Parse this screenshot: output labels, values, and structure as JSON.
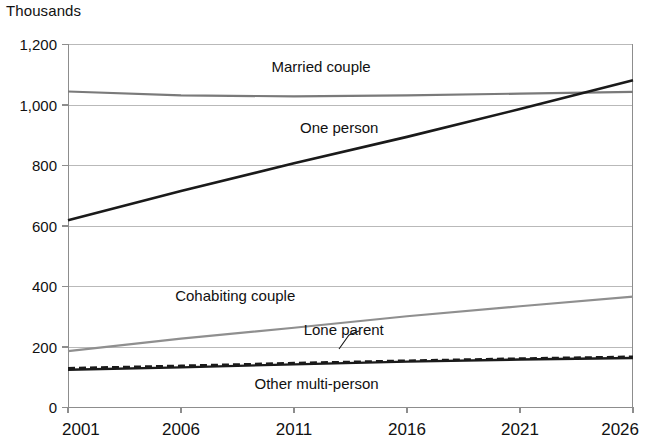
{
  "unit_label": "Thousands",
  "chart_data": {
    "type": "line",
    "title": "",
    "subtitle": "",
    "xlabel": "",
    "ylabel": "Thousands",
    "xlim": [
      2001,
      2026
    ],
    "ylim": [
      0,
      1200
    ],
    "yticks": [
      "0",
      "200",
      "400",
      "600",
      "800",
      "1,000",
      "1,200"
    ],
    "ytick_values": [
      0,
      200,
      400,
      600,
      800,
      1000,
      1200
    ],
    "xticks": [
      "2001",
      "2006",
      "2011",
      "2016",
      "2021",
      "2026"
    ],
    "xtick_values": [
      2001,
      2006,
      2011,
      2016,
      2021,
      2026
    ],
    "grid": true,
    "grid_axis": "y",
    "legend": "inline-labels",
    "x": [
      2001,
      2006,
      2011,
      2016,
      2021,
      2026
    ],
    "series": [
      {
        "name": "Married couple",
        "label": "Married couple",
        "color": "#7a7a7a",
        "style": "solid",
        "width": 2.2,
        "values": [
          1043,
          1030,
          1027,
          1030,
          1036,
          1042
        ],
        "label_x": 2012.2,
        "label_y": 1108
      },
      {
        "name": "One person",
        "label": "One person",
        "color": "#1a1a1a",
        "style": "solid",
        "width": 2.6,
        "values": [
          617,
          714,
          806,
          893,
          985,
          1080
        ],
        "label_x": 2013.0,
        "label_y": 905
      },
      {
        "name": "Cohabiting couple",
        "label": "Cohabiting couple",
        "color": "#8f8f8f",
        "style": "solid",
        "width": 2.2,
        "values": [
          185,
          226,
          262,
          300,
          333,
          365
        ],
        "label_x": 2008.4,
        "label_y": 350
      },
      {
        "name": "Lone parent",
        "label": "Lone parent",
        "color": "#1a1a1a",
        "style": "dashed",
        "width": 2.6,
        "values": [
          128,
          136,
          145,
          153,
          160,
          166
        ],
        "label_x": 2013.2,
        "label_y": 238
      },
      {
        "name": "Other multi-person",
        "label": "Other multi-person",
        "color": "#1a1a1a",
        "style": "solid",
        "width": 2.4,
        "values": [
          123,
          131,
          141,
          150,
          157,
          162
        ],
        "label_x": 2012.0,
        "label_y": 60
      }
    ],
    "annotations": [
      {
        "text": "Lone parent",
        "points_to_series": "Lone parent",
        "leader": true
      }
    ]
  }
}
